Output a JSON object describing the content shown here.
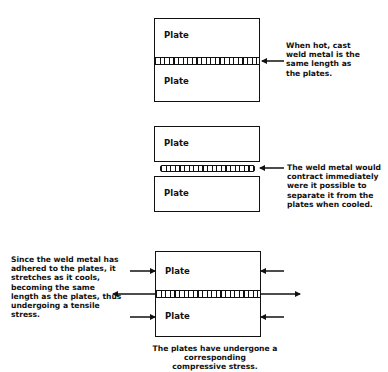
{
  "diagram": {
    "panel1": {
      "top_plate_label": "Plate",
      "bottom_plate_label": "Plate",
      "note": "When hot, cast\nweld metal is the\nsame length as\nthe plates."
    },
    "panel2": {
      "top_plate_label": "Plate",
      "bottom_plate_label": "Plate",
      "note": "The weld metal would\ncontract immediately\nwere it possible to\nseparate it from the\nplates when cooled."
    },
    "panel3": {
      "top_plate_label": "Plate",
      "bottom_plate_label": "Plate",
      "left_note": "Since the weld metal has\nadhered to the plates, it\nstretches as it cools,\nbecoming the same\nlength as the plates, thus\nundergoing a tensile\nstress.",
      "caption": "The plates have undergone a corresponding\ncompressive stress."
    },
    "colors": {
      "line": "#111111",
      "background": "#ffffff"
    }
  }
}
